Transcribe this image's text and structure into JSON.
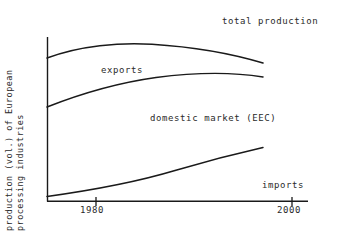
{
  "chart_data": {
    "type": "line",
    "title": "",
    "subtitle": "",
    "xlabel": "",
    "ylabel": "production (vol.) of European processing industries",
    "ylabel_lines": [
      "production (vol.) of European",
      "processing industries",
      "production (vol.) of European processing industries"
    ],
    "xlim": [
      1972,
      2002
    ],
    "ylim": [
      0,
      100
    ],
    "grid": false,
    "legend_position": "inline-annotations",
    "axis_color": "#1a1a1a",
    "line_color": "#1a1a1a",
    "background_color": "#ffffff",
    "x_ticks": [
      1980,
      2000
    ],
    "x_tick_labels": [
      "1980",
      "2000"
    ],
    "y_ticks": [],
    "y_tick_labels": [],
    "annotations": [
      {
        "text": "total production",
        "x": 1997,
        "y": 97
      },
      {
        "text": "exports",
        "x": 1980,
        "y": 72
      },
      {
        "text": "domestic market (EEC)",
        "x": 1987,
        "y": 44
      },
      {
        "text": "imports",
        "x": 1999,
        "y": 10
      }
    ],
    "series": [
      {
        "name": "total production",
        "label": "total production",
        "description": "Upper boundary curve: rises from left edge, peaks near 1985, then declines toward 2000",
        "x": [
          1972,
          1975,
          1978,
          1981,
          1984,
          1987,
          1990,
          1993,
          1996,
          1999
        ],
        "values": [
          87,
          91,
          94,
          96,
          97,
          97,
          96,
          93,
          89,
          84
        ]
      },
      {
        "name": "domestic market (EEC)",
        "label": "domestic market (EEC)",
        "description": "Middle boundary curve separating exports (above) from domestic market (below); rises then flattens and dips slightly",
        "x": [
          1972,
          1975,
          1978,
          1981,
          1984,
          1987,
          1990,
          1993,
          1996,
          1999
        ],
        "values": [
          57,
          63,
          68,
          72,
          75,
          76,
          77,
          77,
          76,
          75
        ]
      },
      {
        "name": "imports",
        "label": "imports",
        "description": "Lower curve rising with increasing slope from near zero at left to about a third of scale at right",
        "x": [
          1972,
          1975,
          1978,
          1981,
          1984,
          1987,
          1990,
          1993,
          1996,
          1999
        ],
        "values": [
          2,
          4,
          6,
          9,
          13,
          18,
          23,
          29,
          37,
          44
        ]
      }
    ]
  },
  "labels": {
    "total_production": "total production",
    "exports": "exports",
    "domestic_market": "domestic market (EEC)",
    "imports": "imports",
    "ylabel_line1": "production (vol.) of European",
    "ylabel_line2": "processing industries",
    "tick_1980": "1980",
    "tick_2000": "2000"
  }
}
